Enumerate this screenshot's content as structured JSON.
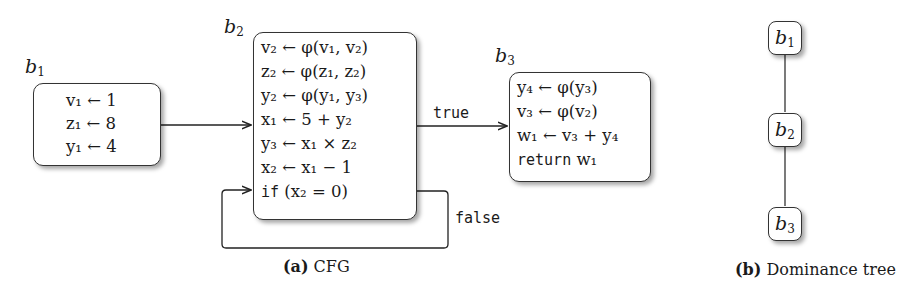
{
  "cfg": {
    "blocks": [
      {
        "id": "b1",
        "label": "b",
        "label_sub": "1",
        "statements": [
          "v₁ ← 1",
          "z₁ ← 8",
          "y₁ ← 4"
        ]
      },
      {
        "id": "b2",
        "label": "b",
        "label_sub": "2",
        "statements": [
          "v₂ ← φ(v₁, v₂)",
          "z₂ ← φ(z₁, z₂)",
          "y₂ ← φ(y₁, y₃)",
          "x₁ ← 5 + y₂",
          "y₃ ← x₁ × z₂",
          "x₂ ← x₁ − 1",
          "(x₂ = 0)"
        ],
        "branch_keyword": "if"
      },
      {
        "id": "b3",
        "label": "b",
        "label_sub": "3",
        "statements": [
          "y₄ ← φ(y₃)",
          "v₃ ← φ(v₂)",
          "w₁ ← v₃ + y₄",
          "w₁"
        ],
        "return_keyword": "return"
      }
    ],
    "edges": [
      {
        "from": "b1",
        "to": "b2",
        "label": ""
      },
      {
        "from": "b2",
        "to": "b3",
        "label": "true"
      },
      {
        "from": "b2",
        "to": "b2",
        "label": "false"
      }
    ],
    "caption_tag": "(a)",
    "caption_text": "CFG"
  },
  "dominance_tree": {
    "nodes": [
      {
        "label": "b",
        "sub": "1"
      },
      {
        "label": "b",
        "sub": "2"
      },
      {
        "label": "b",
        "sub": "3"
      }
    ],
    "edges": [
      [
        "b1",
        "b2"
      ],
      [
        "b2",
        "b3"
      ]
    ],
    "caption_tag": "(b)",
    "caption_text": "Dominance tree"
  }
}
